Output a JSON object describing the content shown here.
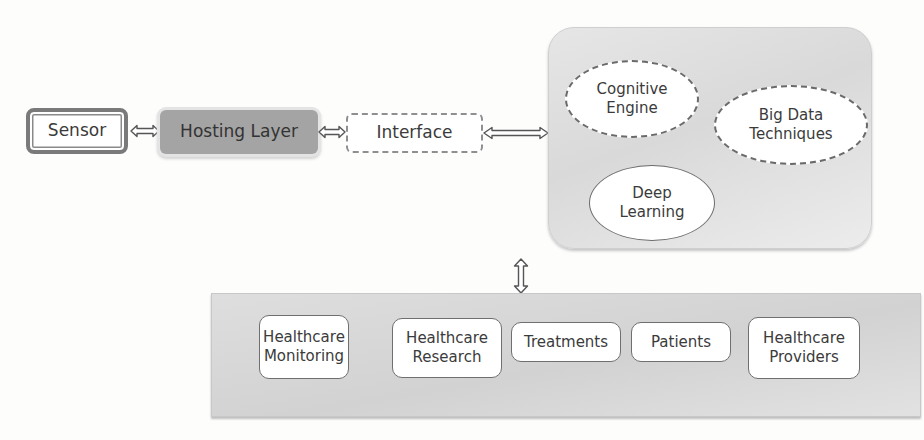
{
  "diagram": {
    "type": "architecture-flow",
    "colors": {
      "hosting_fill": "#a4a4a4",
      "panel_fill": "#dcdcdc",
      "box_fill": "#ffffff",
      "stroke": "#6a6a6a"
    },
    "input_chain": {
      "sensor": {
        "label": "Sensor"
      },
      "hosting_layer": {
        "label": "Hosting Layer"
      },
      "interface": {
        "label": "Interface"
      }
    },
    "processing_panel": {
      "components": [
        {
          "id": "cognitive-engine",
          "line1": "Cognitive",
          "line2": "Engine",
          "style": "dashed-ellipse"
        },
        {
          "id": "big-data-techniques",
          "line1": "Big Data",
          "line2": "Techniques",
          "style": "dashed-ellipse"
        },
        {
          "id": "deep-learning",
          "line1": "Deep",
          "line2": "Learning",
          "style": "solid-ellipse"
        }
      ]
    },
    "applications_panel": {
      "items": [
        {
          "line1": "Healthcare",
          "line2": "Monitoring"
        },
        {
          "line1": "Healthcare",
          "line2": "Research"
        },
        {
          "line1": "Treatments",
          "line2": ""
        },
        {
          "line1": "Patients",
          "line2": ""
        },
        {
          "line1": "Healthcare",
          "line2": "Providers"
        }
      ]
    },
    "connections": [
      {
        "from": "Sensor",
        "to": "Hosting Layer",
        "type": "bidirectional"
      },
      {
        "from": "Hosting Layer",
        "to": "Interface",
        "type": "bidirectional"
      },
      {
        "from": "Interface",
        "to": "processing_panel",
        "type": "bidirectional"
      },
      {
        "from": "processing_panel",
        "to": "applications_panel",
        "type": "bidirectional"
      }
    ]
  }
}
